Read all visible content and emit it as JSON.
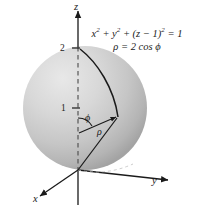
{
  "figure": {
    "name": "spherical-coordinates-sphere-diagram",
    "background_color": "#ffffff",
    "ink_color": "#1a1a1a",
    "sphere": {
      "fill_light": "#e2e2e2",
      "fill_mid": "#c9c9c9",
      "fill_dark": "#a8a8a8",
      "center_px": [
        85,
        108
      ],
      "radius_px": 62
    }
  },
  "equations": {
    "cartesian": {
      "pre": "x",
      "sup1": "2",
      "mid1": " + y",
      "sup2": "2",
      "mid2": " + (z − 1)",
      "sup3": "2",
      "tail": " = 1",
      "plain": "x2 + y2 + (z − 1)2 = 1"
    },
    "spherical": {
      "text": "ρ = 2 cos ϕ"
    }
  },
  "axes": {
    "z_label": "z",
    "y_label": "y",
    "x_label": "x"
  },
  "ticks": {
    "two": "2",
    "one": "1"
  },
  "angle_labels": {
    "phi": "ϕ",
    "rho": "ρ"
  }
}
